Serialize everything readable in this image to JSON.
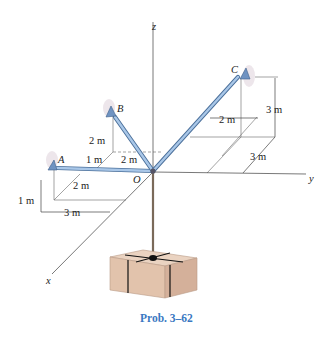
{
  "figure": {
    "caption": "Prob. 3–62",
    "caption_color": "#3a78c2"
  },
  "axes": {
    "x_label": "x",
    "y_label": "y",
    "z_label": "z",
    "origin_label": "O"
  },
  "points": {
    "A_label": "A",
    "B_label": "B",
    "C_label": "C"
  },
  "dimensions": {
    "A_height": "1 m",
    "A_x": "2 m",
    "A_y": "3 m",
    "A_B_gap": "1 m",
    "B_height": "2 m",
    "B_y": "2 m",
    "C_height": "3 m",
    "C_y_offset": "2 m",
    "C_x": "3 m"
  },
  "colors": {
    "strut_fill": "#a9c7e8",
    "strut_edge": "#4a6f9a",
    "box_fill": "#e2c3ac",
    "box_side": "#d4b09a",
    "rope": "#7a6a5a",
    "axis_line": "#555555"
  }
}
